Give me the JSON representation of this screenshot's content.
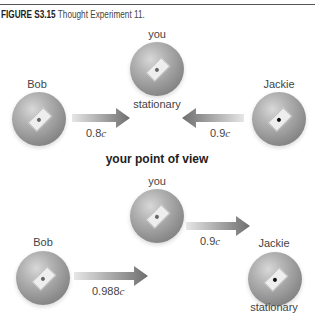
{
  "caption": {
    "figure_label": "FIGURE S3.15",
    "text": "Thought Experiment 11."
  },
  "top_panel": {
    "bob": {
      "name": "Bob",
      "speed": "0.8",
      "speed_unit": "c"
    },
    "you": {
      "name": "you",
      "state": "stationary"
    },
    "jackie": {
      "name": "Jackie",
      "speed": "0.9",
      "speed_unit": "c"
    }
  },
  "divider_label": "your point of view",
  "bottom_panel": {
    "bob": {
      "name": "Bob",
      "speed": "0.988",
      "speed_unit": "c"
    },
    "you": {
      "name": "you",
      "speed": "0.9",
      "speed_unit": "c"
    },
    "jackie": {
      "name": "Jackie",
      "state": "stationary"
    }
  },
  "colors": {
    "sphere": "#9a9a9a",
    "arrow": "#7a7a7a",
    "rule": "#555555"
  }
}
